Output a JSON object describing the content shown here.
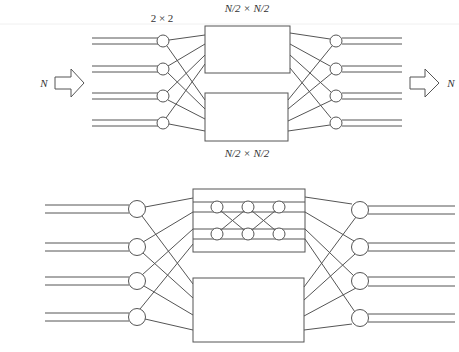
{
  "figure": {
    "colors": {
      "stroke": "#555555",
      "text": "#333333",
      "background": "#ffffff"
    }
  },
  "top_diagram": {
    "switch_label": "2 × 2",
    "upper_subnetwork_label": "N/2 × N/2",
    "lower_subnetwork_label": "N/2 × N/2",
    "input_label": "N",
    "output_label": "N",
    "input_switch_count": 4,
    "output_switch_count": 4,
    "subnetwork_count": 2
  },
  "bottom_diagram": {
    "input_switch_count": 4,
    "output_switch_count": 4,
    "upper_subnetwork": {
      "expanded": true,
      "inner_switch_columns": 3,
      "inner_switch_rows": 2
    },
    "lower_subnetwork": {
      "expanded": false
    }
  }
}
